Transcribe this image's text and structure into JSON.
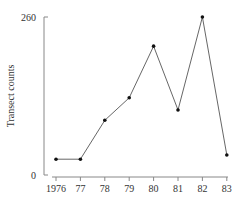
{
  "chart_data": {
    "type": "line",
    "title": "",
    "xlabel": "",
    "ylabel": "Transect counts",
    "categories": [
      "1976",
      "77",
      "78",
      "79",
      "80",
      "81",
      "82",
      "83"
    ],
    "series": [
      {
        "name": "Transect counts",
        "values": [
          26,
          26,
          90,
          127,
          212,
          107,
          260,
          33
        ]
      }
    ],
    "ylim": [
      0,
      260
    ],
    "y_ticks": [
      "0",
      "260"
    ],
    "grid": false,
    "legend": "none",
    "line_color": "#555555",
    "marker_color": "#111111"
  }
}
